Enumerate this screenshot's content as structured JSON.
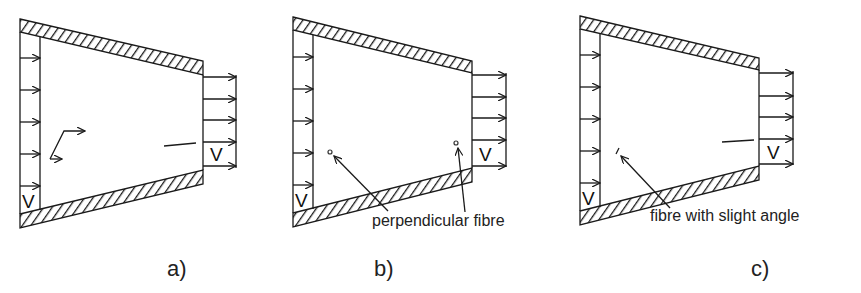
{
  "figure": {
    "panels": [
      {
        "id": "a",
        "label": "a)",
        "velocity_symbol_inlet": "V",
        "velocity_symbol_outlet": "V",
        "annotation": null,
        "feature": "fibre trajectory with rotation (zigzag path) and aligned fibre near outlet"
      },
      {
        "id": "b",
        "label": "b)",
        "velocity_symbol_inlet": "V",
        "velocity_symbol_outlet": "V",
        "annotation": "perpendicular fibre",
        "feature": "two fibres seen end-on (dots) indicated by arrows"
      },
      {
        "id": "c",
        "label": "c)",
        "velocity_symbol_inlet": "V",
        "velocity_symbol_outlet": "V",
        "annotation": "fibre with slight angle",
        "feature": "slightly tilted fibre near inlet and aligned fibre near outlet"
      }
    ]
  }
}
